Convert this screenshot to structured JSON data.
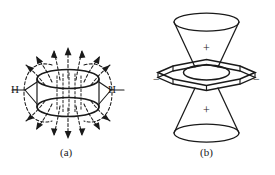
{
  "figure": {
    "background_color": "#ffffff",
    "ink_color": "#1a1a1a",
    "width": 275,
    "height": 175
  },
  "panel_a": {
    "caption": "(a)",
    "description": "Induced magnetic field lines around a benzene ring viewed edge-on, with the pi electron cloud shown as two stacked ellipses.",
    "atom_labels": [
      {
        "name": "hydrogen-left",
        "text": "H"
      },
      {
        "name": "hydrogen-right",
        "text": "H"
      }
    ],
    "field_lines_style": "dashed",
    "field_line_arrows": "outward from top, downward at bottom, looping around the sides"
  },
  "panel_b": {
    "caption": "(b)",
    "description": "Shielding and deshielding cone regions of benzene; hexagonal ring drawn in perspective with an inner circle, double cones above and below.",
    "region_labels": [
      {
        "name": "shielding-cone-top",
        "text": "+"
      },
      {
        "name": "shielding-cone-bottom",
        "text": "+"
      },
      {
        "name": "deshielding-region-left",
        "text": "−"
      },
      {
        "name": "deshielding-region-right",
        "text": "−"
      }
    ]
  }
}
